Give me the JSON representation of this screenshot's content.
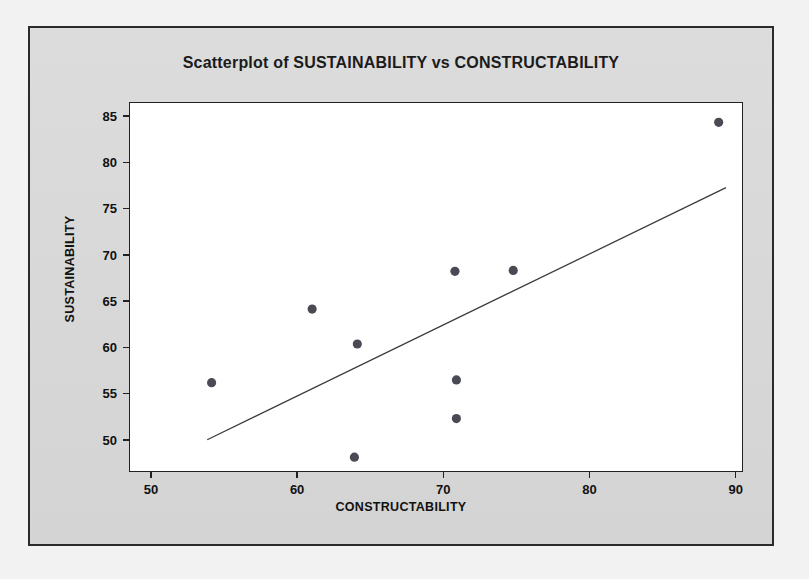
{
  "figure": {
    "title": "Scatterplot of SUSTAINABILITY vs CONSTRUCTABILITY",
    "x_axis_title": "CONSTRUCTABILITY",
    "y_axis_title": "SUSTAINABILITY",
    "point_color": "#4a4a55",
    "line_color": "#3c3c3c",
    "plot_background": "#ffffff",
    "panel_background": "#d9d9d9",
    "border_color": "#2b2b2b"
  },
  "chart_data": {
    "type": "scatter",
    "title": "Scatterplot of SUSTAINABILITY vs CONSTRUCTABILITY",
    "xlabel": "CONSTRUCTABILITY",
    "ylabel": "SUSTAINABILITY",
    "xlim": [
      48.5,
      90.5
    ],
    "ylim": [
      46.5,
      86.5
    ],
    "xticks": [
      50,
      60,
      70,
      80,
      90
    ],
    "yticks": [
      50,
      55,
      60,
      65,
      70,
      75,
      80,
      85
    ],
    "xtick_labels": [
      "50",
      "60",
      "70",
      "80",
      "90"
    ],
    "ytick_labels": [
      "50",
      "55",
      "60",
      "65",
      "70",
      "75",
      "80",
      "85"
    ],
    "grid": false,
    "legend": null,
    "series": [
      {
        "name": "SUSTAINABILITY vs CONSTRUCTABILITY",
        "marker": "filled-circle",
        "points": [
          {
            "x": 54.1,
            "y": 56.1
          },
          {
            "x": 61.0,
            "y": 64.1
          },
          {
            "x": 64.1,
            "y": 60.3
          },
          {
            "x": 63.9,
            "y": 48.0
          },
          {
            "x": 70.8,
            "y": 68.2
          },
          {
            "x": 70.9,
            "y": 56.4
          },
          {
            "x": 70.9,
            "y": 52.2
          },
          {
            "x": 74.8,
            "y": 68.3
          },
          {
            "x": 88.9,
            "y": 84.4
          }
        ]
      }
    ],
    "fit_line": {
      "type": "linear-regression",
      "x_start": 53.8,
      "y_start": 49.9,
      "x_end": 89.4,
      "y_end": 77.3
    }
  }
}
